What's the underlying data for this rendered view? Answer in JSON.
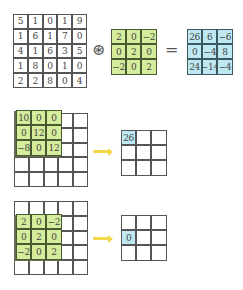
{
  "equation": {
    "input": [
      [
        "5",
        "1",
        "0",
        "1",
        "9"
      ],
      [
        "1",
        "6",
        "1",
        "7",
        "0"
      ],
      [
        "4",
        "1",
        "6",
        "3",
        "5"
      ],
      [
        "1",
        "8",
        "0",
        "1",
        "0"
      ],
      [
        "2",
        "2",
        "8",
        "0",
        "4"
      ]
    ],
    "operator": "⊛",
    "kernel": [
      [
        "2",
        "0",
        "−2"
      ],
      [
        "0",
        "2",
        "0"
      ],
      [
        "−2",
        "0",
        "2"
      ]
    ],
    "equals": "=",
    "output": [
      [
        "26",
        "6",
        "−6"
      ],
      [
        "0",
        "−4",
        "8"
      ],
      [
        "24",
        "−14",
        "−4"
      ]
    ]
  },
  "step1": {
    "overlay": [
      [
        "10",
        "0",
        "0"
      ],
      [
        "0",
        "12",
        "0"
      ],
      [
        "−8",
        "0",
        "12"
      ]
    ],
    "result": [
      [
        "26",
        "",
        ""
      ],
      [
        "",
        "",
        ""
      ],
      [
        "",
        "",
        ""
      ]
    ],
    "highlight": {
      "row": 0,
      "col": 0
    }
  },
  "step2": {
    "overlay": [
      [
        "2",
        "0",
        "−2"
      ],
      [
        "0",
        "2",
        "0"
      ],
      [
        "−2",
        "0",
        "2"
      ]
    ],
    "result": [
      [
        "",
        "",
        ""
      ],
      [
        "0",
        "",
        ""
      ],
      [
        "",
        "",
        ""
      ]
    ],
    "highlight": {
      "row": 1,
      "col": 0
    }
  },
  "colors": {
    "kernel_fill": "#d4ec9c",
    "output_fill": "#bfe9f2",
    "arrow": "#f4d64a"
  }
}
